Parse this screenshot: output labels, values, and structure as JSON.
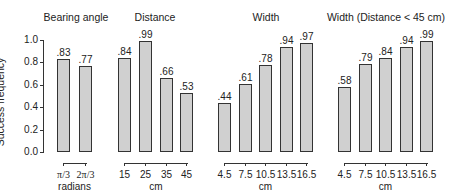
{
  "chart_data": [
    {
      "type": "bar",
      "title": "Bearing angle",
      "categories": [
        "π/3",
        "2π/3"
      ],
      "values": [
        0.83,
        0.77
      ],
      "value_labels": [
        ".83",
        ".77"
      ],
      "xlabel": "radians",
      "ylabel": "Success frequency",
      "ylim": [
        0,
        1.0
      ]
    },
    {
      "type": "bar",
      "title": "Distance",
      "categories": [
        "15",
        "25",
        "35",
        "45"
      ],
      "values": [
        0.84,
        0.99,
        0.66,
        0.53
      ],
      "value_labels": [
        ".84",
        ".99",
        ".66",
        ".53"
      ],
      "xlabel": "cm",
      "ylabel": "Success frequency",
      "ylim": [
        0,
        1.0
      ]
    },
    {
      "type": "bar",
      "title": "Width",
      "categories": [
        "4.5",
        "7.5",
        "10.5",
        "13.5",
        "16.5"
      ],
      "values": [
        0.44,
        0.61,
        0.78,
        0.94,
        0.97
      ],
      "value_labels": [
        ".44",
        ".61",
        ".78",
        ".94",
        ".97"
      ],
      "xlabel": "cm",
      "ylabel": "Success frequency",
      "ylim": [
        0,
        1.0
      ]
    },
    {
      "type": "bar",
      "title": "Width (Distance < 45 cm)",
      "categories": [
        "4.5",
        "7.5",
        "10.5",
        "13.5",
        "16.5"
      ],
      "values": [
        0.58,
        0.79,
        0.84,
        0.94,
        0.99
      ],
      "value_labels": [
        ".58",
        ".79",
        ".84",
        ".94",
        ".99"
      ],
      "xlabel": "cm",
      "ylabel": "Success frequency",
      "ylim": [
        0,
        1.0
      ]
    }
  ],
  "axis": {
    "ylabel": "Success frequency",
    "yticks": [
      "1.0",
      "0.8",
      "0.6",
      "0.4",
      "0.2",
      "0.0"
    ],
    "grid": false
  },
  "style": {
    "bar_fill": "#d0d0d0",
    "bar_stroke": "#333333"
  }
}
